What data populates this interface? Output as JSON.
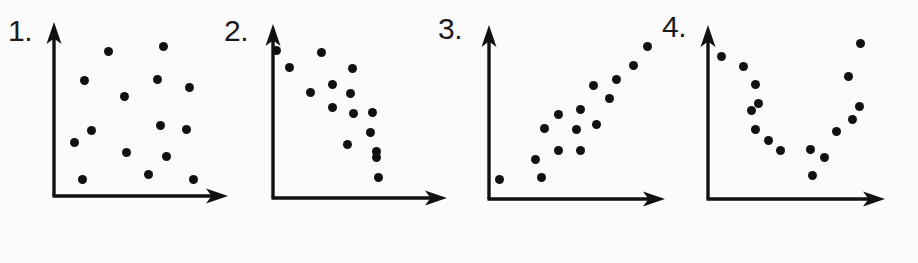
{
  "figure": {
    "width": 918,
    "height": 263,
    "background_color": "#fbfbfb",
    "ink_color": "#111111"
  },
  "chart_data": [
    {
      "type": "scatter",
      "title": "1.",
      "label": "1.",
      "pattern": "no correlation",
      "xlabel": "",
      "ylabel": "",
      "grid": false,
      "legend": "none",
      "axis": {
        "origin_x": 54,
        "origin_y": 196,
        "y_top": 22,
        "x_right": 228,
        "arrow_heads": [
          "up",
          "right"
        ]
      },
      "xlim": [
        54,
        228
      ],
      "ylim": [
        22,
        196
      ],
      "n_points": 15,
      "points": [
        {
          "x": 108.7,
          "y": 51.3
        },
        {
          "x": 163.3,
          "y": 46.7
        },
        {
          "x": 84.3,
          "y": 80.7
        },
        {
          "x": 157.3,
          "y": 79.0
        },
        {
          "x": 189.7,
          "y": 87.0
        },
        {
          "x": 124.0,
          "y": 96.7
        },
        {
          "x": 91.7,
          "y": 130.0
        },
        {
          "x": 160.7,
          "y": 125.0
        },
        {
          "x": 186.7,
          "y": 129.3
        },
        {
          "x": 74.3,
          "y": 142.7
        },
        {
          "x": 126.7,
          "y": 152.7
        },
        {
          "x": 166.3,
          "y": 156.0
        },
        {
          "x": 82.7,
          "y": 179.3
        },
        {
          "x": 148.7,
          "y": 174.0
        },
        {
          "x": 193.7,
          "y": 179.3
        }
      ],
      "label_pos": {
        "x": 8,
        "y": 16
      }
    },
    {
      "type": "scatter",
      "title": "2.",
      "label": "2.",
      "pattern": "negative correlation",
      "xlabel": "",
      "ylabel": "",
      "grid": false,
      "legend": "none",
      "axis": {
        "origin_x": 273,
        "origin_y": 198,
        "y_top": 24,
        "x_right": 447,
        "arrow_heads": [
          "up",
          "right"
        ]
      },
      "xlim": [
        273,
        447
      ],
      "ylim": [
        24,
        198
      ],
      "n_points": 15,
      "points": [
        {
          "x": 276.7,
          "y": 50.7
        },
        {
          "x": 321.7,
          "y": 52.7
        },
        {
          "x": 289.3,
          "y": 67.0
        },
        {
          "x": 352.3,
          "y": 68.7
        },
        {
          "x": 332.0,
          "y": 84.0
        },
        {
          "x": 310.0,
          "y": 92.0
        },
        {
          "x": 350.0,
          "y": 93.0
        },
        {
          "x": 332.7,
          "y": 107.3
        },
        {
          "x": 353.0,
          "y": 113.0
        },
        {
          "x": 372.7,
          "y": 112.3
        },
        {
          "x": 370.7,
          "y": 132.7
        },
        {
          "x": 347.3,
          "y": 144.0
        },
        {
          "x": 376.7,
          "y": 151.7
        },
        {
          "x": 376.3,
          "y": 157.3
        },
        {
          "x": 378.3,
          "y": 177.7
        }
      ],
      "label_pos": {
        "x": 224,
        "y": 16
      }
    },
    {
      "type": "scatter",
      "title": "3.",
      "label": "3.",
      "pattern": "positive correlation",
      "xlabel": "",
      "ylabel": "",
      "grid": false,
      "legend": "none",
      "axis": {
        "origin_x": 489,
        "origin_y": 199,
        "y_top": 25,
        "x_right": 665,
        "arrow_heads": [
          "up",
          "right"
        ]
      },
      "xlim": [
        489,
        665
      ],
      "ylim": [
        25,
        199
      ],
      "n_points": 15,
      "points": [
        {
          "x": 647.0,
          "y": 46.3
        },
        {
          "x": 633.3,
          "y": 65.0
        },
        {
          "x": 616.7,
          "y": 79.7
        },
        {
          "x": 593.0,
          "y": 85.3
        },
        {
          "x": 609.7,
          "y": 98.3
        },
        {
          "x": 580.0,
          "y": 109.3
        },
        {
          "x": 558.3,
          "y": 114.7
        },
        {
          "x": 596.0,
          "y": 124.0
        },
        {
          "x": 544.3,
          "y": 128.0
        },
        {
          "x": 576.0,
          "y": 129.0
        },
        {
          "x": 558.0,
          "y": 150.0
        },
        {
          "x": 580.0,
          "y": 150.0
        },
        {
          "x": 535.0,
          "y": 159.0
        },
        {
          "x": 541.0,
          "y": 177.3
        },
        {
          "x": 499.0,
          "y": 179.0
        }
      ],
      "label_pos": {
        "x": 438,
        "y": 14
      }
    },
    {
      "type": "scatter",
      "title": "4.",
      "label": "4.",
      "pattern": "non-linear / U-shaped relationship",
      "xlabel": "",
      "ylabel": "",
      "grid": false,
      "legend": "none",
      "axis": {
        "origin_x": 708,
        "origin_y": 199,
        "y_top": 25,
        "x_right": 885,
        "arrow_heads": [
          "up",
          "right"
        ]
      },
      "xlim": [
        708,
        885
      ],
      "ylim": [
        25,
        199
      ],
      "n_points": 16,
      "points": [
        {
          "x": 860.0,
          "y": 43.3
        },
        {
          "x": 721.7,
          "y": 56.3
        },
        {
          "x": 743.3,
          "y": 66.7
        },
        {
          "x": 848.3,
          "y": 76.0
        },
        {
          "x": 755.3,
          "y": 84.3
        },
        {
          "x": 758.7,
          "y": 103.3
        },
        {
          "x": 859.3,
          "y": 106.7
        },
        {
          "x": 751.7,
          "y": 110.0
        },
        {
          "x": 852.7,
          "y": 119.7
        },
        {
          "x": 755.7,
          "y": 129.7
        },
        {
          "x": 836.7,
          "y": 131.7
        },
        {
          "x": 768.0,
          "y": 140.0
        },
        {
          "x": 810.0,
          "y": 149.3
        },
        {
          "x": 780.0,
          "y": 150.0
        },
        {
          "x": 824.3,
          "y": 157.7
        },
        {
          "x": 812.7,
          "y": 175.0
        }
      ],
      "label_pos": {
        "x": 662,
        "y": 12
      }
    }
  ]
}
